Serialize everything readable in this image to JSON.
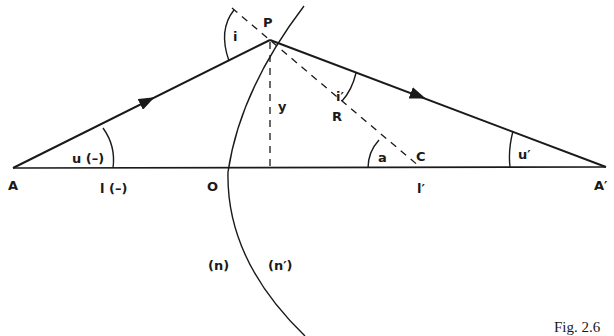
{
  "figure": {
    "caption": "Fig. 2.6",
    "colors": {
      "ink": "#1a1a1a",
      "background": "#ffffff"
    }
  },
  "points": {
    "A": "A",
    "A_prime": "A′",
    "P": "P",
    "O": "O",
    "C": "C",
    "R": "R"
  },
  "angles": {
    "incidence": "i",
    "refraction": "i′",
    "object_slope": "u (–)",
    "image_slope": "u′",
    "center_angle": "a"
  },
  "distances": {
    "object_distance": "l (–)",
    "image_distance": "l′",
    "height": "y"
  },
  "media": {
    "left": "(n)",
    "right": "(n′)"
  }
}
